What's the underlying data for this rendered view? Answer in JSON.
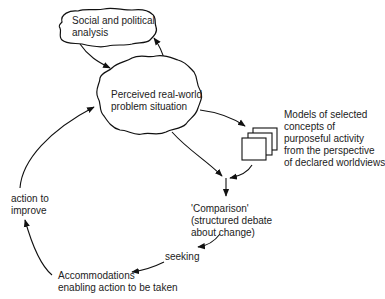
{
  "diagram": {
    "nodes": {
      "social_political": {
        "label": "Social and political\nanalysis",
        "shape": "cloud"
      },
      "perceived": {
        "label": "Perceived real-world\nproblem situation",
        "shape": "cloud"
      },
      "models": {
        "label": "Models of selected\nconcepts of\npurposeful activity\nfrom the perspective\nof declared worldviews",
        "shape": "stacked-pages"
      },
      "comparison": {
        "label": "'Comparison'\n(structured debate\nabout change)",
        "shape": "text"
      },
      "accommodations": {
        "label": "Accommodations\nenabling action to be taken",
        "shape": "text"
      }
    },
    "edge_labels": {
      "seeking": "seeking",
      "action": "action to\nimprove"
    },
    "edges": [
      {
        "from": "social_political",
        "to": "perceived"
      },
      {
        "from": "perceived",
        "to": "social_political"
      },
      {
        "from": "perceived",
        "to": "models"
      },
      {
        "from": "perceived",
        "to": "comparison"
      },
      {
        "from": "models",
        "to": "comparison"
      },
      {
        "from": "comparison",
        "to": "accommodations",
        "label": "seeking"
      },
      {
        "from": "accommodations",
        "to": "perceived",
        "label": "action to improve"
      }
    ],
    "colors": {
      "stroke": "#111111",
      "text": "#222222",
      "background": "#ffffff"
    }
  }
}
